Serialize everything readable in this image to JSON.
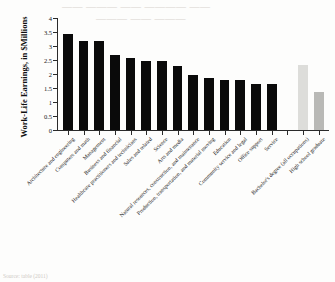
{
  "page": {
    "bleed_text_line1": "—— ——— —— ———— ——",
    "bleed_text_line2": "——— —— ———",
    "source_note": "Source: table (2011)"
  },
  "chart_data": {
    "type": "bar",
    "title": "",
    "xlabel": "",
    "ylabel": "Work-Life Earnings, in $Millions",
    "ylim": [
      0,
      4
    ],
    "ytick_values": [
      0,
      0.5,
      1,
      1.5,
      2,
      2.5,
      3,
      3.5,
      4
    ],
    "ytick_labels": [
      "0",
      "0.5",
      "1",
      "1.5",
      "2",
      "2.5",
      "3",
      "3.5",
      "4"
    ],
    "grid": false,
    "legend": "none",
    "categories": [
      "Architecture and engineering",
      "Computers and math",
      "Management",
      "Business and financial",
      "Healthcare practitioners and technicians",
      "Sales and related",
      "Science",
      "Arts and media",
      "Natural resources, construction, and maintenance",
      "Production, transportation, and material moving",
      "Education",
      "Community service and legal",
      "Office support",
      "Service",
      "",
      "Bachelor's degree (all occupations)",
      "High school graduate"
    ],
    "values": [
      3.42,
      3.19,
      3.19,
      2.67,
      2.58,
      2.47,
      2.47,
      2.28,
      1.96,
      1.86,
      1.77,
      1.77,
      1.65,
      1.64,
      null,
      2.33,
      1.34
    ],
    "bar_colors": [
      "#0a0a0a",
      "#0a0a0a",
      "#0a0a0a",
      "#0a0a0a",
      "#0a0a0a",
      "#0a0a0a",
      "#0a0a0a",
      "#0a0a0a",
      "#0a0a0a",
      "#0a0a0a",
      "#0a0a0a",
      "#0a0a0a",
      "#0a0a0a",
      "#0a0a0a",
      "none",
      "#ddddda",
      "#b9b9b6"
    ]
  }
}
